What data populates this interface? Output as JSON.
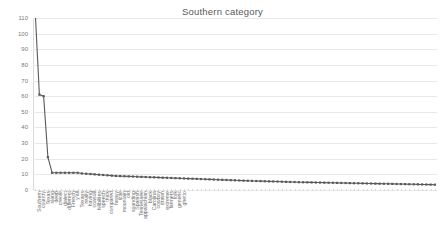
{
  "chart": {
    "title": "Southern category",
    "yaxis": {
      "label": "",
      "min": 0,
      "max": 110,
      "step": 10
    }
  },
  "chart_data": {
    "type": "line",
    "title": "Southern category",
    "xlabel": "",
    "ylabel": "",
    "ylim": [
      0,
      110
    ],
    "grid": true,
    "legend": "none",
    "marker": "square",
    "line_color": "#595959",
    "categories": [
      "Southern",
      "country",
      "Texas",
      "slang",
      "deep",
      "creole",
      "dialect",
      "different",
      "French",
      "y'all",
      "Texans",
      "really",
      "having",
      "coastal",
      "hillbillies",
      "speech",
      "thick",
      "compared",
      "heavy",
      "little",
      "mountain",
      "old",
      "sounding",
      "Spanish",
      "Tennessee",
      "appalachian",
      "black",
      "Carolina",
      "cowboy",
      "drawn",
      "extreme",
      "farmers",
      "folk",
      "generic",
      "ghetto",
      "hick",
      "hillbilly",
      "Louisiana",
      "Mississippi",
      "new",
      "north",
      "people",
      "redneck",
      "rural",
      "south",
      "talk",
      "twang",
      "Virginia",
      "west",
      "accent",
      "Alabama",
      "Arkansas",
      "Atlanta",
      "bayou",
      "Cajun",
      "Charleston",
      "city",
      "coast",
      "cotton",
      "countryside",
      "dialects",
      "drawl",
      "east",
      "farm",
      "Florida",
      "Georgia",
      "gulf",
      "Houston",
      "Kentucky",
      "language",
      "Memphis",
      "Missouri",
      "Nashville",
      "Oklahoma",
      "plantation",
      "rebel",
      "region",
      "rural south",
      "Savannah",
      "slow",
      "southeast",
      "southerners",
      "states",
      "strong",
      "sweet",
      "talking",
      "tea",
      "Tennessean",
      "town",
      "tradition",
      "twangy",
      "voice",
      "western",
      "word",
      "words"
    ],
    "values": [
      115,
      61,
      60,
      21,
      11,
      11,
      11,
      11,
      11,
      11,
      11,
      10.6,
      10.4,
      10.2,
      10,
      9.8,
      9.6,
      9.4,
      9.2,
      9,
      8.9,
      8.8,
      8.7,
      8.6,
      8.5,
      8.4,
      8.3,
      8.2,
      8.1,
      8,
      7.9,
      7.8,
      7.7,
      7.6,
      7.5,
      7.4,
      7.3,
      7.2,
      7.1,
      7,
      6.9,
      6.8,
      6.7,
      6.6,
      6.5,
      6.4,
      6.3,
      6.2,
      6.1,
      6,
      5.9,
      5.8,
      5.75,
      5.7,
      5.6,
      5.5,
      5.45,
      5.4,
      5.3,
      5.2,
      5.15,
      5.1,
      5,
      4.95,
      4.9,
      4.85,
      4.8,
      4.75,
      4.7,
      4.65,
      4.6,
      4.55,
      4.5,
      4.45,
      4.4,
      4.35,
      4.3,
      4.25,
      4.2,
      4.15,
      4.1,
      4.05,
      4,
      3.95,
      3.9,
      3.85,
      3.8,
      3.75,
      3.7,
      3.65,
      3.6,
      3.55,
      3.5,
      3.45,
      3.4
    ],
    "yticks": [
      0,
      10,
      20,
      30,
      40,
      50,
      60,
      70,
      80,
      90,
      100,
      110
    ],
    "visible_xtick_labels": [
      "Southern",
      "country",
      "Texas",
      "slang",
      "deep",
      "creole",
      "dialect",
      "different",
      "French",
      "y'all",
      "Texans",
      "really",
      "having",
      "coastal",
      "hillbillies",
      "speech",
      "thick",
      "compared",
      "heavy",
      "little",
      "mountain",
      "old",
      "sounding",
      "Spanish",
      "Tennessee",
      "appalachian",
      "black",
      "Carolina",
      "cowboy",
      "drawn",
      "extreme",
      "farmers",
      "folk",
      "generic",
      "ghetto"
    ]
  }
}
